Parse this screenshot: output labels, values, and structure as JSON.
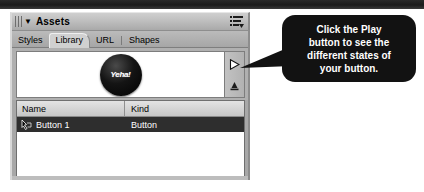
{
  "window": {
    "top_bar_color": "#1b1b1b",
    "background_color": "#ffffff"
  },
  "panel": {
    "title": "Assets",
    "collapse_arrow": "▼",
    "grip_icon": "grip-dots-icon",
    "menu_icon": "panel-options-menu-icon",
    "panel_bg": "#a8a8a8"
  },
  "tabs": [
    {
      "label": "Styles",
      "active": false
    },
    {
      "label": "Library",
      "active": true
    },
    {
      "label": "URL",
      "active": false
    },
    {
      "label": "Shapes",
      "active": false
    }
  ],
  "preview": {
    "button_label": "Yeha!",
    "button_color": "#000000",
    "canvas_color": "#ffffff",
    "play_button_name": "play-button",
    "stop_button_name": "stop-button"
  },
  "list": {
    "columns": [
      "Name",
      "Kind"
    ],
    "rows": [
      {
        "icon": "button-hand-cursor-icon",
        "name": "Button 1",
        "kind": "Button",
        "selected": true
      }
    ],
    "selected_row_color": "#2e2e2e"
  },
  "callout": {
    "text": "Click the Play\nbutton to see the\ndifferent states of\nyour button.",
    "background": "#121212",
    "text_color": "#ffffff"
  }
}
